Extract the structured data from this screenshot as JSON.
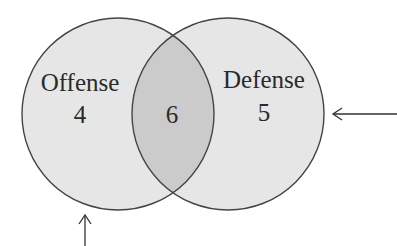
{
  "diagram": {
    "type": "venn",
    "sets": [
      {
        "id": "offense",
        "label": "Offense",
        "only_count": "4"
      },
      {
        "id": "defense",
        "label": "Defense",
        "only_count": "5"
      }
    ],
    "intersection": {
      "sets": [
        "offense",
        "defense"
      ],
      "count": "6"
    },
    "arrows": [
      {
        "id": "arrow-bottom",
        "direction": "up",
        "points_to": "offense circle"
      },
      {
        "id": "arrow-right",
        "direction": "left",
        "points_to": "defense circle"
      }
    ],
    "colors": {
      "circle_fill": "#e6e6e6",
      "intersection_fill": "#cbcbcb",
      "stroke": "#444444",
      "text": "#2a2a2a"
    }
  }
}
